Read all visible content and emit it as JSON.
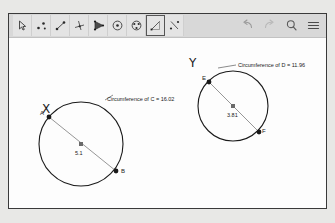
{
  "app": {
    "title": "geometry-canvas"
  },
  "toolbar": {
    "tools": [
      {
        "name": "move-tool",
        "label": "Move",
        "selected": false
      },
      {
        "name": "point-tool",
        "label": "Point",
        "selected": false
      },
      {
        "name": "line-tool",
        "label": "Line",
        "selected": false
      },
      {
        "name": "perpendicular-line-tool",
        "label": "Perpendicular Line",
        "selected": false
      },
      {
        "name": "polygon-tool",
        "label": "Polygon",
        "selected": false
      },
      {
        "name": "circle-center-point-tool",
        "label": "Circle with Center through Point",
        "selected": false
      },
      {
        "name": "ellipse-tool",
        "label": "Ellipse",
        "selected": false
      },
      {
        "name": "angle-measure-tool",
        "label": "Angle",
        "selected": true
      },
      {
        "name": "reflect-tool",
        "label": "Reflect about Line",
        "selected": false
      }
    ],
    "actions": [
      {
        "name": "undo-button",
        "label": "Undo"
      },
      {
        "name": "redo-button",
        "label": "Redo"
      },
      {
        "name": "search-button",
        "label": "Search"
      },
      {
        "name": "menu-button",
        "label": "Menu"
      }
    ]
  },
  "canvas": {
    "figures": [
      {
        "id": "circle-x",
        "title": "X",
        "title_x": 33,
        "title_y": 64,
        "center_x": 72,
        "center_y": 106,
        "radius": 42,
        "diameter_label": "5.1",
        "diameter_label_x": 66,
        "diameter_label_y": 112,
        "endpoints": [
          {
            "label": "A",
            "x": 40,
            "y": 79,
            "label_x": 31,
            "label_y": 72
          },
          {
            "label": "B",
            "x": 107,
            "y": 133,
            "label_x": 112,
            "label_y": 130
          }
        ],
        "measure_text": "Circumference of C = 16.02",
        "measure_x": 98,
        "measure_y": 58,
        "leader": {
          "x1": 96,
          "y1": 62,
          "x2": 104,
          "y2": 57
        }
      },
      {
        "id": "circle-y",
        "title": "Y",
        "title_x": 180,
        "title_y": 18,
        "center_x": 224,
        "center_y": 68,
        "radius": 35,
        "diameter_label": "3.81",
        "diameter_label_x": 218,
        "diameter_label_y": 74,
        "endpoints": [
          {
            "label": "E",
            "x": 200,
            "y": 44,
            "label_x": 193,
            "label_y": 37
          },
          {
            "label": "F",
            "x": 250,
            "y": 94,
            "label_x": 253,
            "label_y": 90
          }
        ],
        "measure_text": "Circumference of D = 11.96",
        "measure_x": 229,
        "measure_y": 24,
        "leader": {
          "x1": 209,
          "y1": 30,
          "x2": 227,
          "y2": 27
        }
      }
    ]
  },
  "colors": {
    "window_bg": "#ffffff",
    "canvas_bg": "#fdfdfd",
    "toolbar_bg": "#d8d8d8",
    "page_bg": "#e8e8e6",
    "stroke": "#1a1a1a",
    "diameter_stroke": "#8a8a8a",
    "selected_border": "#555555"
  }
}
